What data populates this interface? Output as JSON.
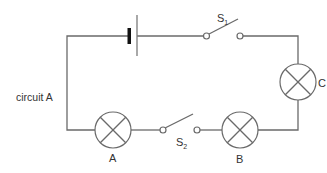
{
  "diagram": {
    "title": "circuit A",
    "components": {
      "battery": {
        "label": ""
      },
      "switch_1": {
        "label": "S",
        "subscript": "1",
        "state": "open"
      },
      "switch_2": {
        "label": "S",
        "subscript": "2",
        "state": "open"
      },
      "lamp_a": {
        "label": "A"
      },
      "lamp_b": {
        "label": "B"
      },
      "lamp_c": {
        "label": "C"
      }
    },
    "colors": {
      "wire": "#6a6a6a",
      "battery_negative": "#111111",
      "text": "#333333"
    }
  }
}
